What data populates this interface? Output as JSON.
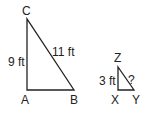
{
  "diagram": {
    "large_triangle": {
      "vertices": {
        "A": "A",
        "B": "B",
        "C": "C"
      },
      "side_labels": {
        "AC": "9 ft",
        "CB": "11 ft"
      }
    },
    "small_triangle": {
      "vertices": {
        "X": "X",
        "Y": "Y",
        "Z": "Z"
      },
      "side_labels": {
        "XZ": "3 ft",
        "ZY": "?"
      }
    },
    "colors": {
      "line": "#222222",
      "background": "#ffffff"
    }
  }
}
